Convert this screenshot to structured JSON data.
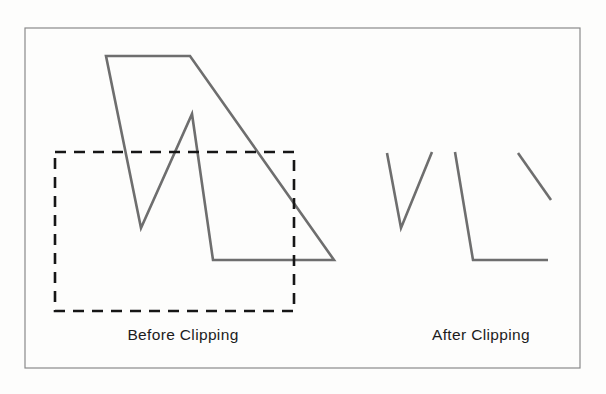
{
  "figure": {
    "background_color": "#fdfdfc",
    "frame": {
      "name": "outer-border",
      "x": 25,
      "y": 28,
      "width": 555,
      "height": 340,
      "stroke_color": "#8a8a8a",
      "stroke_width": 1.2
    },
    "captions": {
      "before": "Before Clipping",
      "after": "After Clipping"
    },
    "colors": {
      "polyline": "#6e6e6e",
      "clip_rect": "#161616",
      "text": "#1c1c1c",
      "border": "#8a8a8a"
    },
    "before_panel": {
      "polyline": {
        "name": "source-polygon",
        "stroke_color": "#6e6e6e",
        "stroke_width": 2.6,
        "closed": true,
        "points": [
          [
            106,
            56
          ],
          [
            190,
            56
          ],
          [
            334,
            260
          ],
          [
            213,
            260
          ],
          [
            192,
            114
          ],
          [
            141,
            228
          ]
        ]
      },
      "clip_window": {
        "name": "clip-rectangle",
        "x": 55,
        "y": 152,
        "width": 239,
        "height": 159,
        "stroke_color": "#161616",
        "stroke_width": 2.6,
        "dash_pattern": "11 8"
      }
    },
    "after_panel": {
      "stroke_color": "#6e6e6e",
      "stroke_width": 2.6,
      "fragments": [
        {
          "name": "fragment-v-left",
          "points": [
            [
              387,
              153
            ],
            [
              401,
              228
            ],
            [
              432,
              152
            ]
          ]
        },
        {
          "name": "fragment-l-shape",
          "points": [
            [
              455,
              152
            ],
            [
              473,
              260
            ],
            [
              548,
              260
            ]
          ]
        },
        {
          "name": "fragment-diagonal-right",
          "points": [
            [
              518,
              153
            ],
            [
              551,
              200
            ]
          ]
        }
      ]
    }
  }
}
